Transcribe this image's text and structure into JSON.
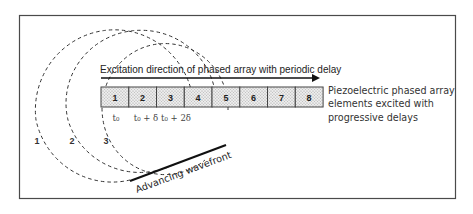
{
  "diagram": {
    "title": "Excitation direction of phased array with periodic delay",
    "array": {
      "element_labels": [
        "1",
        "2",
        "3",
        "4",
        "5",
        "6",
        "7",
        "8"
      ],
      "fill_pattern": "dotted-gray"
    },
    "time_labels": [
      "t₀",
      "t₀ + δ",
      "t₀ + 2δ"
    ],
    "wavefront_labels": [
      "1",
      "2",
      "3"
    ],
    "side_description": {
      "lines": [
        "Piezoelectric phased array",
        "elements excited with",
        "progressive delays"
      ]
    },
    "wavefront_caption": "Advancing wavefront",
    "colors": {
      "stroke": "#111111",
      "frame": "#4a4a4a",
      "cell_fill": "#e6e6e6"
    }
  }
}
